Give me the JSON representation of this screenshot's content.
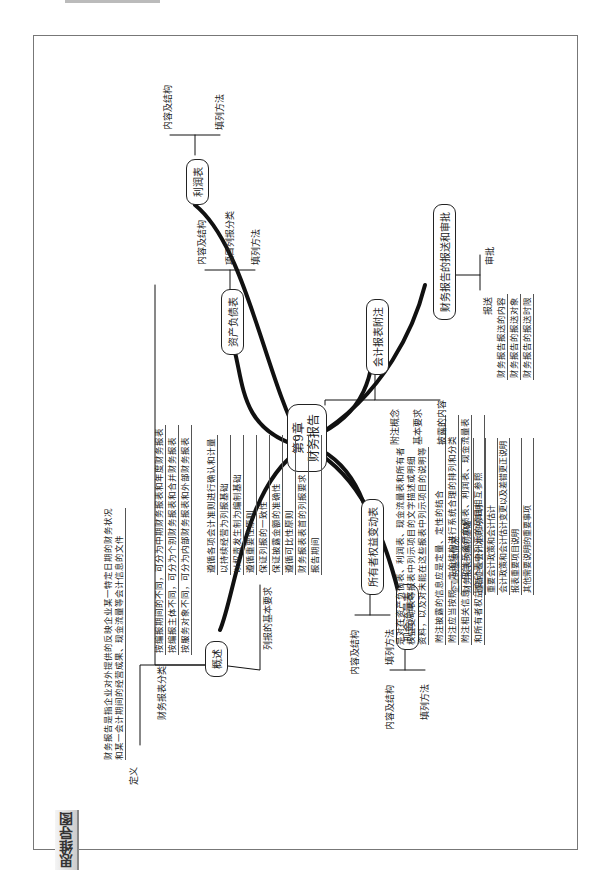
{
  "page": {
    "top_text": "",
    "corner_tag": "思维导图"
  },
  "root": {
    "line1": "第9章",
    "line2": "财务报告"
  },
  "branches": {
    "overview": {
      "label": "概述",
      "definition": {
        "label": "定义",
        "text_line1": "财务报告是指企业对外提供的反映企业某一特定日期的财务状况",
        "text_line2": "和某一会计期间的经营成果、现金流量等会计信息的文件"
      },
      "classification": {
        "label": "财务报表分类",
        "items": [
          "按编报期间的不同，可分为中期财务报表和年度财务报表",
          "按编报主体不同，可分为个别财务报表和合并财务报表",
          "按服务对象不同，可分为内部财务报表和外部财务报表"
        ]
      },
      "requirements": {
        "label": "列报的基本要求",
        "items": [
          "遵循各项会计准则进行确认和计量",
          "以持续经营为列报基础",
          "以权责发生制为编制基础",
          "遵循重要性原则",
          "保证列报的一致性",
          "保证披露金额的准确性",
          "遵循可比性原则",
          "财务报表表首的列报要求",
          "报告期间"
        ]
      }
    },
    "balance_sheet": {
      "label": "资产负债表",
      "items": [
        "内容及结构",
        "项目列报分类",
        "填列方法"
      ]
    },
    "income_statement": {
      "label": "利润表",
      "items": [
        "内容及结构",
        "填列方法"
      ]
    },
    "cash_flow": {
      "label": "现金流量表",
      "items": [
        "内容及结构",
        "填列方法"
      ]
    },
    "equity_changes": {
      "label": "所有者权益变动表",
      "items": [
        "内容及结构",
        "填列方法"
      ]
    },
    "notes": {
      "label": "会计报表附注",
      "concept": {
        "label": "附注概念",
        "text": [
          "是对在资产负债表、利润表、现金流量表和所有者",
          "权益变动表等报表中列示项目的文字描述或明细",
          "资料，以及对未能在这些报表中列示项目的说明等"
        ]
      },
      "basic_requirements": {
        "label": "基本要求",
        "items": [
          "附注披露的信息应是定量、定性的结合",
          "附注应当按照一定的结构进行系统合理的排列和分类",
          "附注相关信息，应当与资产负债表、利润表、现金流量表",
          "和所有者权益变动表中列示的项目相互参照"
        ]
      },
      "disclosure": {
        "label": "披露的内容",
        "items": [
          "企业的基本情况",
          "财务报表的编制基础",
          "遵循企业会计准则的声明",
          "重要会计政策和会计估计",
          "会计政策和会计估计变更以及差错更正说明",
          "报表重要项目说明",
          "其他需要说明的重要事项"
        ]
      }
    },
    "submission": {
      "label": "财务报告的报送和审批",
      "send": {
        "label": "报送",
        "items": [
          "财务报告报送的内容",
          "财务报告的报送对象",
          "财务报告的报送时限"
        ]
      },
      "approve": {
        "label": "审批"
      }
    }
  },
  "colors": {
    "line": "#111111",
    "frame": "#777777",
    "text": "#222222"
  }
}
